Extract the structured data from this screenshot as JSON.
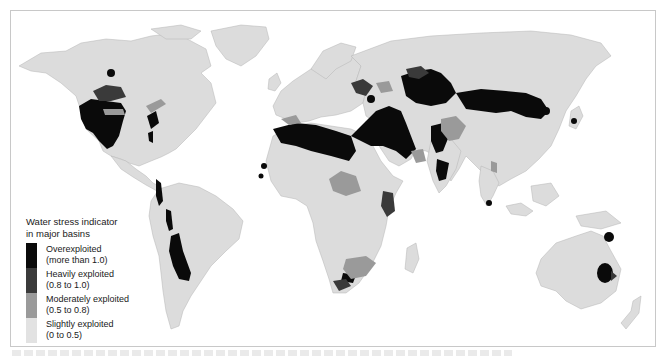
{
  "map": {
    "title": "World water stress by major basin",
    "colors": {
      "land": "#dcdcdc",
      "water": "#ffffff",
      "overexploited": "#0a0a0a",
      "heavily": "#3a3a3a",
      "moderately": "#9a9a9a",
      "slightly": "#dcdcdc"
    }
  },
  "legend": {
    "title_line1": "Water stress indicator",
    "title_line2": "in major basins",
    "items": [
      {
        "label": "Overexploited",
        "range": "(more than 1.0)",
        "color": "#0a0a0a"
      },
      {
        "label": "Heavily exploited",
        "range": "(0.8 to 1.0)",
        "color": "#3a3a3a"
      },
      {
        "label": "Moderately exploited",
        "range": "(0.5 to 0.8)",
        "color": "#9a9a9a"
      },
      {
        "label": "Slightly exploited",
        "range": "(0 to 0.5)",
        "color": "#e2e2e2"
      }
    ]
  }
}
